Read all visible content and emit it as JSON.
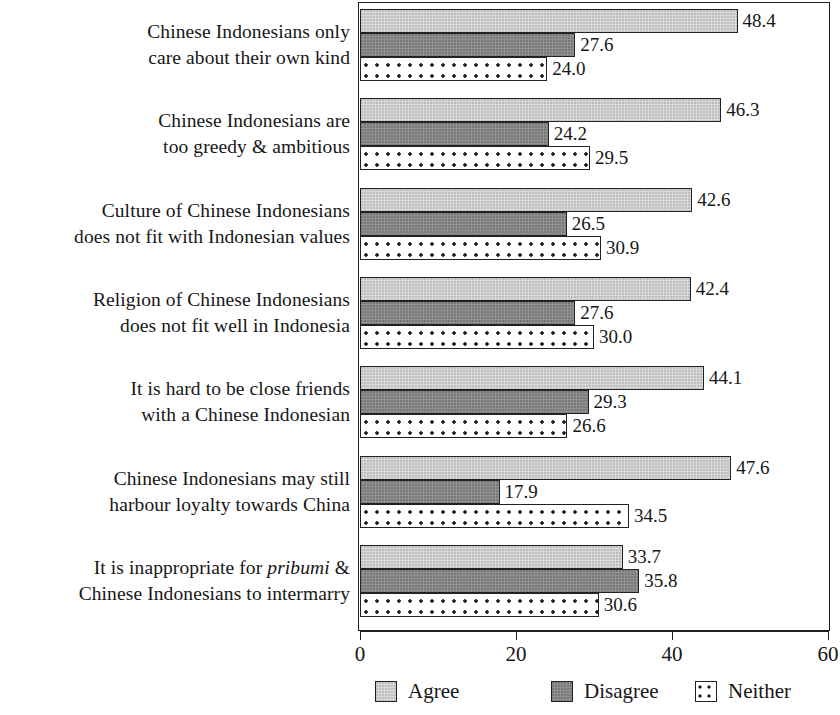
{
  "chart_data": {
    "type": "bar",
    "orientation": "horizontal",
    "title": "",
    "subtitle": "",
    "xlabel": "",
    "ylabel": "",
    "xlim": [
      0,
      60
    ],
    "xticks": [
      0,
      20,
      40,
      60
    ],
    "xtick_labels": [
      "0",
      "20",
      "40",
      "60"
    ],
    "grid": false,
    "legend_position": "bottom",
    "categories": [
      "Chinese Indonesians only care about their own kind",
      "Chinese Indonesians are too greedy & ambitious",
      "Culture of Chinese Indonesians does not fit with Indonesian values",
      "Religion of Chinese Indonesians does not fit well in Indonesia",
      "It is hard to be close friends with a Chinese Indonesian",
      "Chinese Indonesians may still harbour loyalty towards China",
      "It is inappropriate for pribumi & Chinese Indonesians to intermarry"
    ],
    "category_lines": [
      [
        "Chinese Indonesians only",
        "care about their own kind"
      ],
      [
        "Chinese Indonesians are",
        "too greedy & ambitious"
      ],
      [
        "Culture of Chinese Indonesians",
        "does not fit with Indonesian values"
      ],
      [
        "Religion of Chinese Indonesians",
        "does not fit well in Indonesia"
      ],
      [
        "It is hard to be close friends",
        "with a Chinese Indonesian"
      ],
      [
        "Chinese Indonesians may still",
        "harbour loyalty towards China"
      ],
      [
        "It is inappropriate for |pribumi| &",
        "Chinese Indonesians to intermarry"
      ]
    ],
    "series": [
      {
        "name": "Agree",
        "color": "#d8d8d8",
        "pattern": "light-stipple",
        "values": [
          48.4,
          46.3,
          42.6,
          42.4,
          44.1,
          47.6,
          33.7
        ],
        "labels": [
          "48.4",
          "46.3",
          "42.6",
          "42.4",
          "44.1",
          "47.6",
          "33.7"
        ]
      },
      {
        "name": "Disagree",
        "color": "#909090",
        "pattern": "dark-solid",
        "values": [
          27.6,
          24.2,
          26.5,
          27.6,
          29.3,
          17.9,
          35.8
        ],
        "labels": [
          "27.6",
          "24.2",
          "26.5",
          "27.6",
          "29.3",
          "17.9",
          "35.8"
        ]
      },
      {
        "name": "Neither",
        "color": "#ffffff",
        "pattern": "dotted",
        "values": [
          24.0,
          29.5,
          30.9,
          30.0,
          26.6,
          34.5,
          30.6
        ],
        "labels": [
          "24.0",
          "29.5",
          "30.9",
          "30.0",
          "26.6",
          "34.5",
          "30.6"
        ]
      }
    ]
  },
  "legend": {
    "items": [
      {
        "label": "Agree",
        "swatch": "agree"
      },
      {
        "label": "Disagree",
        "swatch": "disagree"
      },
      {
        "label": "Neither",
        "swatch": "neither"
      }
    ]
  }
}
